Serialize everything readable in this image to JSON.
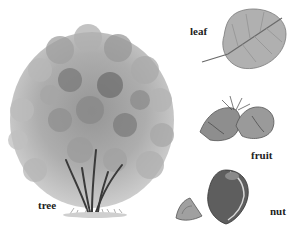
{
  "diagram": {
    "title": "",
    "parts": [
      {
        "id": "tree",
        "label": "tree"
      },
      {
        "id": "leaf",
        "label": "leaf"
      },
      {
        "id": "fruit",
        "label": "fruit"
      },
      {
        "id": "nut",
        "label": "nut"
      }
    ],
    "colors": {
      "background": "#ffffff",
      "foliage_light": "#c4c4c4",
      "foliage_mid": "#9a9a9a",
      "foliage_dark": "#6a6a6a",
      "trunk": "#3a3a3a",
      "leaf": "#a8a8a8",
      "nut": "#5a5a5a",
      "label": "#222222"
    }
  }
}
